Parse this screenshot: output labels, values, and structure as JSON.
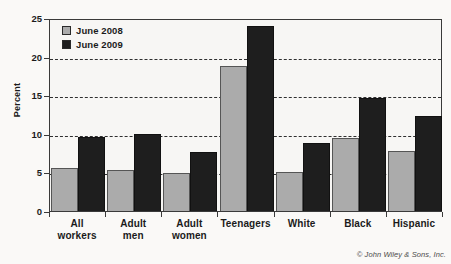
{
  "chart_data": {
    "type": "bar",
    "title": "June 2008 and June 2009",
    "xlabel": "",
    "ylabel": "Percent",
    "ylim": [
      0,
      25
    ],
    "yticks": [
      0,
      5,
      10,
      15,
      20,
      25
    ],
    "grid": true,
    "legend_position": "top-left",
    "categories": [
      "All\nworkers",
      "Adult\nmen",
      "Adult\nwomen",
      "Teenagers",
      "White",
      "Black",
      "Hispanic"
    ],
    "series": [
      {
        "name": "June 2008",
        "color": "#ababab",
        "values": [
          5.6,
          5.3,
          4.9,
          18.8,
          5.1,
          9.4,
          7.8
        ]
      },
      {
        "name": "June 2009",
        "color": "#1e1e1e",
        "values": [
          9.6,
          10.0,
          7.7,
          24.0,
          8.8,
          14.7,
          12.3
        ]
      }
    ]
  },
  "credit": "© John Wiley & Sons, Inc."
}
